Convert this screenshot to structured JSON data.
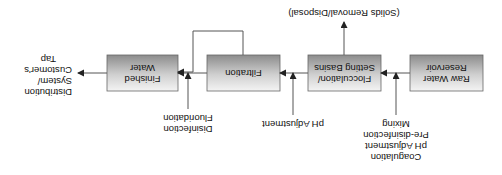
{
  "diagram": {
    "orientation": "rotated-180",
    "colors": {
      "box_gradient_top": "#f2f2f2",
      "box_gradient_bottom": "#8e8e8e",
      "box_border": "#666666",
      "line": "#555555",
      "text": "#111111",
      "background": "#ffffff"
    },
    "boxes": [
      {
        "id": "raw-water",
        "lines": [
          "Raw Water",
          "Reservoir"
        ]
      },
      {
        "id": "flocculation",
        "lines": [
          "Flocculation/",
          "Setting Basins"
        ]
      },
      {
        "id": "filtration",
        "lines": [
          "Filtration"
        ]
      },
      {
        "id": "finished-water",
        "lines": [
          "Finished",
          "Water"
        ]
      }
    ],
    "outputs": {
      "solids": "(Solids Removal/Disposal)",
      "distribution": [
        "Distribution",
        "System/",
        "Customer's",
        "Tap"
      ]
    },
    "chemical_inputs": [
      {
        "target": "flocculation",
        "lines": [
          "Coagulation",
          "pH Adjustment",
          "Pre-disinfection",
          "Mixing"
        ]
      },
      {
        "target": "filtration",
        "lines": [
          "pH Adjustment"
        ]
      },
      {
        "target": "finished-water",
        "lines": [
          "Disinfection",
          "Fluoridation"
        ]
      }
    ],
    "connections": [
      {
        "from": "raw-water",
        "to": "flocculation"
      },
      {
        "from": "flocculation",
        "to": "filtration"
      },
      {
        "from": "flocculation",
        "to": "solids"
      },
      {
        "from": "filtration",
        "to": "finished-water"
      },
      {
        "from": "filtration",
        "to": "finished-water",
        "type": "bypass-loop"
      },
      {
        "from": "finished-water",
        "to": "distribution"
      }
    ]
  }
}
